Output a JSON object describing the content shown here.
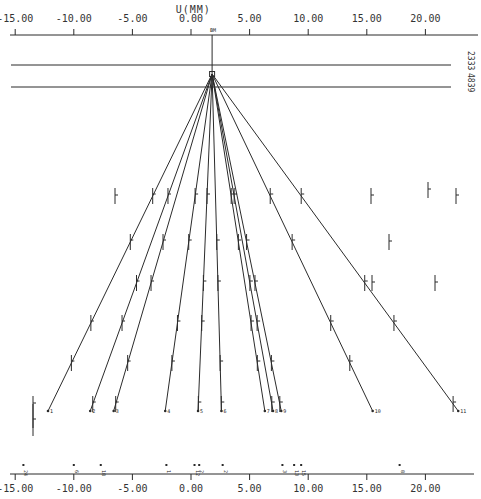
{
  "chart_data": {
    "type": "line",
    "title": "",
    "xlabel": "U(MM)",
    "ylabel": "",
    "xlim": [
      -15.5,
      23.5
    ],
    "x_ticks": [
      -15,
      -10,
      -5,
      0,
      5,
      10,
      15,
      20
    ],
    "x_tick_labels": [
      "-15.00",
      "-10.00",
      "-5.00",
      "0.00",
      "5.00",
      "10.00",
      "15.00",
      "20.00"
    ],
    "grid": false,
    "vertex": {
      "label": "BM",
      "u_mm": 1.8
    },
    "reference_lines": [
      {
        "label": "2333"
      },
      {
        "label": "4839"
      }
    ],
    "tracks": [
      {
        "id": "1",
        "u_end_mm": -12.2
      },
      {
        "id": "2",
        "u_end_mm": -8.6
      },
      {
        "id": "3",
        "u_end_mm": -6.6
      },
      {
        "id": "4",
        "u_end_mm": -2.2
      },
      {
        "id": "5",
        "u_end_mm": 0.6
      },
      {
        "id": "6",
        "u_end_mm": 2.6
      },
      {
        "id": "7",
        "u_end_mm": 6.3
      },
      {
        "id": "8",
        "u_end_mm": 7.0
      },
      {
        "id": "9",
        "u_end_mm": 7.7
      },
      {
        "id": "10",
        "u_end_mm": 15.5
      },
      {
        "id": "11",
        "u_end_mm": 22.8
      }
    ],
    "bottom_markers": [
      {
        "label": "24",
        "u_mm": -14.3
      },
      {
        "label": "6",
        "u_mm": -10.0
      },
      {
        "label": "18",
        "u_mm": -7.7
      },
      {
        "label": "1",
        "u_mm": -2.1
      },
      {
        "label": "12",
        "u_mm": 0.3
      },
      {
        "label": "2",
        "u_mm": 0.7
      },
      {
        "label": "2",
        "u_mm": 2.7
      },
      {
        "label": "3",
        "u_mm": 7.8
      },
      {
        "label": "13",
        "u_mm": 8.8
      },
      {
        "label": "15",
        "u_mm": 9.4
      },
      {
        "label": "8",
        "u_mm": 17.8
      }
    ]
  }
}
